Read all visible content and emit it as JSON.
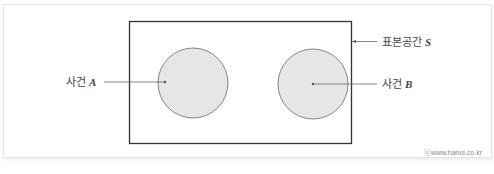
{
  "diagram": {
    "type": "venn-diagram",
    "sample_space": {
      "label": "표본공간",
      "variable": "S"
    },
    "events": [
      {
        "label": "사건",
        "variable": "A",
        "fill": "#e6e6e6",
        "stroke": "#777777"
      },
      {
        "label": "사건",
        "variable": "B",
        "fill": "#e6e6e6",
        "stroke": "#777777"
      }
    ],
    "relationship": "disjoint",
    "watermark": "ⓒwww.hanol.co.kr"
  },
  "colors": {
    "rect_stroke": "#333333",
    "leader_line": "#555555",
    "circle_fill": "#e6e6e6",
    "circle_stroke": "#777777"
  }
}
